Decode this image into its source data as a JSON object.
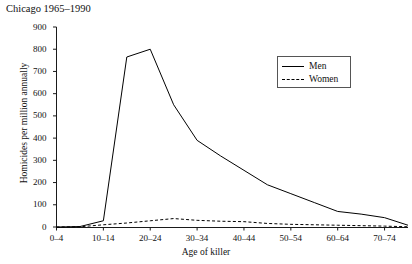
{
  "chart_data": {
    "type": "line",
    "title": "Chicago 1965–1990",
    "xlabel": "Age of killer",
    "ylabel": "Homicides per million annually",
    "categories": [
      "0–4",
      "5–9",
      "10–14",
      "15–19",
      "20–24",
      "25–29",
      "30–34",
      "35–39",
      "40–44",
      "45–49",
      "50–54",
      "55–59",
      "60–64",
      "65–69",
      "70–74",
      "75–79"
    ],
    "xticklabels": [
      "0–4",
      "10–14",
      "20–24",
      "30–34",
      "40–44",
      "50–54",
      "60–64",
      "70–74"
    ],
    "yticklabels": [
      "0",
      "100",
      "200",
      "300",
      "400",
      "500",
      "600",
      "700",
      "800",
      "900"
    ],
    "ylim": [
      0,
      900
    ],
    "ytick_step": 100,
    "grid": false,
    "legend_position": "upper-right-inside",
    "series": [
      {
        "name": "Men",
        "linestyle": "solid",
        "color": "#000000",
        "values": [
          0,
          2,
          28,
          765,
          800,
          550,
          390,
          320,
          255,
          190,
          150,
          110,
          70,
          58,
          42,
          8
        ]
      },
      {
        "name": "Women",
        "linestyle": "dashed",
        "color": "#000000",
        "values": [
          0,
          1,
          10,
          18,
          28,
          38,
          30,
          26,
          24,
          16,
          12,
          10,
          8,
          6,
          4,
          1
        ]
      }
    ]
  },
  "legend": {
    "entries": [
      {
        "label": "Men",
        "style": "solid"
      },
      {
        "label": "Women",
        "style": "dashed"
      }
    ]
  }
}
